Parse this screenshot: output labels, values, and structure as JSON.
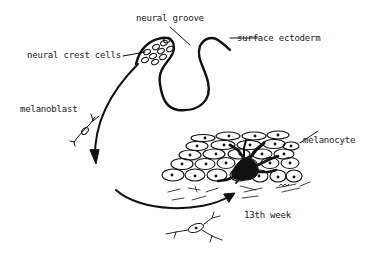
{
  "diagram": {
    "type": "biology-illustration",
    "labels": {
      "neural_groove": "neural groove",
      "surface_ectoderm": "surface ectoderm",
      "neural_crest_cells": "neural crest cells",
      "melanoblast": "melanoblast",
      "melanocyte": "melanocyte",
      "timepoint": "13th week"
    },
    "colors": {
      "line": "#111111",
      "background": "#ffffff",
      "text": "#222222"
    }
  }
}
